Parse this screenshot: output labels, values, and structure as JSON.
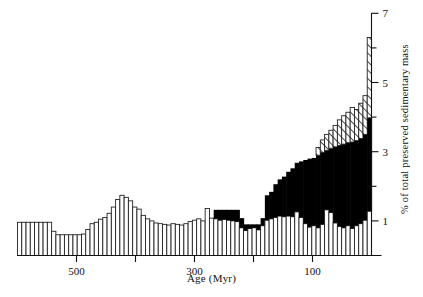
{
  "figure": {
    "axes": {
      "x_title": "Age (Myr)",
      "y_title": "% of total preserved sedimentary mass"
    }
  },
  "chart_data": {
    "type": "bar",
    "title": "",
    "xlabel": "Age (Myr)",
    "ylabel": "% of total preserved sedimentary mass",
    "xlim": [
      600,
      0
    ],
    "ylim": [
      0,
      7.2
    ],
    "x_direction": "reversed",
    "grid": false,
    "legend": null,
    "x_major_ticks": [
      500,
      400,
      300,
      200,
      100
    ],
    "x_tick_labels": [
      "500",
      "",
      "300",
      "",
      "100"
    ],
    "y_major_ticks": [
      1,
      3,
      5,
      7
    ],
    "y_minor_ticks": [
      2,
      4,
      6
    ],
    "y_tick_labels": [
      "1",
      "3",
      "5",
      "7"
    ],
    "bin_width_myr": 10,
    "series": [
      {
        "name": "white",
        "fill": "#ffffff",
        "stroke": "#222222",
        "values": [
          0.96,
          0.96,
          0.96,
          0.96,
          0.96,
          0.96,
          0.96,
          0.96,
          0.7,
          0.6,
          0.6,
          0.6,
          0.6,
          0.6,
          0.6,
          0.62,
          0.75,
          0.92,
          0.96,
          1.05,
          1.1,
          1.22,
          1.4,
          1.62,
          1.74,
          1.68,
          1.58,
          1.4,
          1.34,
          1.16,
          1.06,
          1.0,
          0.94,
          0.92,
          0.9,
          0.88,
          0.92,
          0.9,
          0.88,
          0.92,
          0.98,
          1.02,
          1.06,
          1.0,
          1.36,
          1.08,
          1.06,
          1.02,
          1.04,
          1.02,
          1.0,
          0.98,
          0.8,
          0.72,
          0.78,
          0.8,
          0.74,
          0.86,
          1.02,
          1.06,
          1.1,
          1.14,
          1.12,
          1.14,
          1.12,
          1.26,
          1.1,
          0.92,
          0.82,
          0.86,
          0.8,
          0.9,
          1.32,
          1.24,
          0.94,
          0.84,
          0.8,
          0.86,
          0.78,
          0.86,
          0.92,
          1.02,
          1.28
        ]
      },
      {
        "name": "black",
        "fill": "#000000",
        "stroke": "#000000",
        "values": [
          0,
          0,
          0,
          0,
          0,
          0,
          0,
          0,
          0,
          0,
          0,
          0,
          0,
          0,
          0,
          0,
          0,
          0,
          0,
          0,
          0,
          0,
          0,
          0,
          0,
          0,
          0,
          0,
          0,
          0,
          0,
          0,
          0,
          0,
          0,
          0,
          0,
          0,
          0,
          0,
          0,
          0,
          0,
          0,
          0,
          0,
          0.26,
          0.3,
          0.28,
          0.3,
          0.32,
          0.34,
          0.28,
          0.18,
          0.12,
          0.1,
          0.16,
          0.22,
          0.72,
          0.78,
          0.96,
          1.06,
          1.16,
          1.28,
          1.4,
          1.42,
          1.62,
          1.84,
          1.98,
          1.96,
          2.1,
          2.08,
          1.72,
          1.86,
          2.2,
          2.34,
          2.42,
          2.4,
          2.5,
          2.46,
          2.46,
          2.48,
          2.7
        ]
      },
      {
        "name": "hatched",
        "fill": "hatch",
        "stroke": "#222222",
        "values": [
          0,
          0,
          0,
          0,
          0,
          0,
          0,
          0,
          0,
          0,
          0,
          0,
          0,
          0,
          0,
          0,
          0,
          0,
          0,
          0,
          0,
          0,
          0,
          0,
          0,
          0,
          0,
          0,
          0,
          0,
          0,
          0,
          0,
          0,
          0,
          0,
          0,
          0,
          0,
          0,
          0,
          0,
          0,
          0,
          0,
          0,
          0,
          0,
          0,
          0,
          0,
          0,
          0,
          0,
          0,
          0,
          0,
          0,
          0,
          0,
          0,
          0,
          0,
          0,
          0,
          0,
          0,
          0,
          0,
          0,
          0.22,
          0.36,
          0.46,
          0.52,
          0.62,
          0.74,
          0.82,
          0.88,
          1.0,
          0.9,
          1.02,
          1.12,
          2.32
        ]
      }
    ]
  }
}
